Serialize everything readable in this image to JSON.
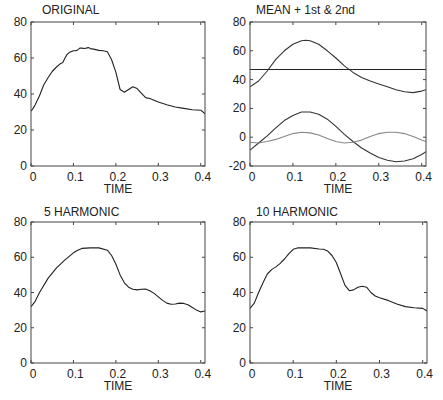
{
  "figure": {
    "xlabel": "TIME"
  },
  "chart_data": [
    {
      "type": "line",
      "title": "ORIGINAL",
      "xlabel": "TIME",
      "ylabel": "",
      "xlim": [
        0,
        0.41
      ],
      "ylim": [
        0,
        80
      ],
      "xticks": [
        0,
        0.1,
        0.2,
        0.3,
        0.4
      ],
      "xtick_labels": [
        "0",
        "0.1",
        "0.2",
        "0.3",
        "0.4"
      ],
      "yticks": [
        0,
        20,
        40,
        60,
        80
      ],
      "ytick_labels": [
        "0",
        "20",
        "40",
        "60",
        "80"
      ],
      "grid": false,
      "series": [
        {
          "name": "original",
          "color": "#222222",
          "x": [
            0,
            0.005,
            0.01,
            0.02,
            0.03,
            0.04,
            0.05,
            0.06,
            0.07,
            0.075,
            0.08,
            0.085,
            0.09,
            0.1,
            0.105,
            0.11,
            0.115,
            0.12,
            0.125,
            0.13,
            0.135,
            0.14,
            0.15,
            0.16,
            0.17,
            0.18,
            0.19,
            0.2,
            0.21,
            0.22,
            0.23,
            0.24,
            0.25,
            0.26,
            0.27,
            0.28,
            0.29,
            0.3,
            0.32,
            0.34,
            0.36,
            0.38,
            0.4,
            0.41
          ],
          "y": [
            30.5,
            32,
            34,
            39,
            45,
            49,
            52.5,
            55,
            57,
            57.5,
            60,
            62,
            63,
            64,
            64,
            64.5,
            65.5,
            65.5,
            65.3,
            65.5,
            65.8,
            65.2,
            64.8,
            64.2,
            64,
            63.5,
            59,
            52,
            42.5,
            41,
            42.5,
            44,
            43,
            40.5,
            38,
            37.5,
            36.5,
            35.5,
            34,
            32.8,
            32,
            31.3,
            31,
            29
          ]
        }
      ]
    },
    {
      "type": "line",
      "title": "MEAN + 1st & 2nd",
      "xlabel": "TIME",
      "ylabel": "",
      "xlim": [
        0,
        0.41
      ],
      "ylim": [
        -20,
        80
      ],
      "xticks": [
        0,
        0.1,
        0.2,
        0.3,
        0.4
      ],
      "xtick_labels": [
        "0",
        "0.1",
        "0.2",
        "0.3",
        "0.4"
      ],
      "yticks": [
        -20,
        0,
        20,
        40,
        60,
        80
      ],
      "ytick_labels": [
        "-20",
        "0",
        "20",
        "40",
        "60",
        "80"
      ],
      "grid": false,
      "series": [
        {
          "name": "mean",
          "color": "#222222",
          "x": [
            0,
            0.41
          ],
          "y": [
            47,
            47
          ]
        },
        {
          "name": "mean + components",
          "color": "#333333",
          "x": [
            0,
            0.02,
            0.04,
            0.06,
            0.08,
            0.1,
            0.12,
            0.13,
            0.14,
            0.16,
            0.18,
            0.2,
            0.22,
            0.24,
            0.26,
            0.28,
            0.3,
            0.32,
            0.34,
            0.36,
            0.38,
            0.4,
            0.41
          ],
          "y": [
            35,
            39,
            46,
            54,
            60,
            64.5,
            67,
            67.3,
            67,
            64.5,
            60,
            55,
            49.5,
            45,
            41.5,
            39,
            37,
            35,
            33,
            31.5,
            31,
            32,
            33
          ]
        },
        {
          "name": "1st harmonic",
          "color": "#333333",
          "x": [
            0,
            0.02,
            0.04,
            0.06,
            0.08,
            0.1,
            0.12,
            0.14,
            0.16,
            0.18,
            0.2,
            0.22,
            0.24,
            0.26,
            0.28,
            0.3,
            0.32,
            0.34,
            0.36,
            0.38,
            0.4,
            0.41
          ],
          "y": [
            -9,
            -4,
            1,
            6.5,
            11.5,
            15,
            17.5,
            17.5,
            16,
            12.5,
            7.5,
            2,
            -3,
            -7.5,
            -11,
            -14,
            -16,
            -17,
            -16.5,
            -15,
            -12,
            -10
          ]
        },
        {
          "name": "2nd harmonic",
          "color": "#888888",
          "x": [
            0,
            0.02,
            0.04,
            0.06,
            0.08,
            0.1,
            0.12,
            0.14,
            0.16,
            0.18,
            0.2,
            0.22,
            0.24,
            0.26,
            0.28,
            0.3,
            0.32,
            0.34,
            0.36,
            0.38,
            0.4,
            0.41
          ],
          "y": [
            -3.5,
            -4,
            -3,
            -1.5,
            0.5,
            2.5,
            3.5,
            3,
            1.5,
            -1,
            -3,
            -4,
            -3.5,
            -2,
            0.5,
            2.5,
            3.5,
            3.5,
            2.5,
            0.5,
            -2,
            -3
          ]
        }
      ]
    },
    {
      "type": "line",
      "title": "5 HARMONIC",
      "xlabel": "TIME",
      "ylabel": "",
      "xlim": [
        0,
        0.41
      ],
      "ylim": [
        0,
        80
      ],
      "xticks": [
        0,
        0.1,
        0.2,
        0.3,
        0.4
      ],
      "xtick_labels": [
        "0",
        "0.1",
        "0.2",
        "0.3",
        "0.4"
      ],
      "yticks": [
        0,
        20,
        40,
        60,
        80
      ],
      "ytick_labels": [
        "0",
        "20",
        "40",
        "60",
        "80"
      ],
      "grid": false,
      "series": [
        {
          "name": "5 harmonic",
          "color": "#222222",
          "x": [
            0,
            0.01,
            0.02,
            0.04,
            0.06,
            0.08,
            0.1,
            0.11,
            0.12,
            0.14,
            0.16,
            0.18,
            0.19,
            0.2,
            0.21,
            0.22,
            0.23,
            0.24,
            0.25,
            0.26,
            0.27,
            0.28,
            0.29,
            0.3,
            0.31,
            0.32,
            0.33,
            0.34,
            0.35,
            0.36,
            0.37,
            0.38,
            0.39,
            0.4,
            0.41
          ],
          "y": [
            32,
            35,
            40,
            48,
            54,
            58.5,
            62.5,
            64,
            65,
            65.3,
            65.3,
            64,
            61,
            56,
            50,
            45.5,
            43,
            41.8,
            41.5,
            41.8,
            42,
            41,
            39.5,
            37.5,
            35.5,
            34,
            33.3,
            33.5,
            34,
            33.8,
            33,
            31.5,
            30,
            29,
            29.5
          ]
        }
      ]
    },
    {
      "type": "line",
      "title": "10 HARMONIC",
      "xlabel": "TIME",
      "ylabel": "",
      "xlim": [
        0,
        0.41
      ],
      "ylim": [
        0,
        80
      ],
      "xticks": [
        0,
        0.1,
        0.2,
        0.3,
        0.4
      ],
      "xtick_labels": [
        "0",
        "0.1",
        "0.2",
        "0.3",
        "0.4"
      ],
      "yticks": [
        0,
        20,
        40,
        60,
        80
      ],
      "ytick_labels": [
        "0",
        "20",
        "40",
        "60",
        "80"
      ],
      "grid": false,
      "series": [
        {
          "name": "10 harmonic",
          "color": "#222222",
          "x": [
            0,
            0.01,
            0.02,
            0.03,
            0.04,
            0.05,
            0.06,
            0.07,
            0.08,
            0.09,
            0.1,
            0.11,
            0.12,
            0.14,
            0.16,
            0.17,
            0.18,
            0.19,
            0.2,
            0.21,
            0.22,
            0.23,
            0.24,
            0.25,
            0.26,
            0.27,
            0.28,
            0.29,
            0.3,
            0.32,
            0.34,
            0.36,
            0.38,
            0.4,
            0.41
          ],
          "y": [
            31,
            34,
            40,
            45.5,
            50.5,
            53,
            54.5,
            56.5,
            59,
            62,
            64.5,
            65.3,
            65.3,
            65.3,
            64.7,
            64.5,
            63.5,
            61,
            57,
            50.5,
            44,
            41,
            41.5,
            43,
            43.5,
            43,
            40,
            38,
            37,
            35.5,
            33.5,
            32,
            31.3,
            31,
            29.5
          ]
        }
      ]
    }
  ],
  "panels": [
    {
      "title": "ORIGINAL",
      "xlabel": "TIME"
    },
    {
      "title": "MEAN + 1st & 2nd",
      "xlabel": "TIME"
    },
    {
      "title": "5 HARMONIC",
      "xlabel": "TIME"
    },
    {
      "title": "10 HARMONIC",
      "xlabel": "TIME"
    }
  ]
}
